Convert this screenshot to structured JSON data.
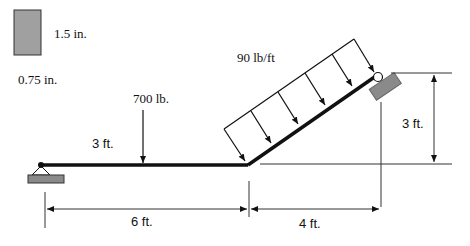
{
  "cross_section": {
    "height_label": "1.5 in.",
    "width_label": "0.75 in.",
    "fill_color": "#a0a0a0"
  },
  "loads": {
    "point_load_label": "700 lb.",
    "point_load_position_label": "3 ft.",
    "distributed_load_label": "90 lb/ft"
  },
  "dimensions": {
    "horizontal_span_label": "6 ft.",
    "inclined_horizontal_label": "4 ft.",
    "vertical_rise_label": "3 ft."
  },
  "supports": {
    "left": "pin-support",
    "right": "roller-support",
    "support_fill": "#8a8a8a"
  },
  "colors": {
    "beam": "#111111",
    "lines": "#333333"
  }
}
